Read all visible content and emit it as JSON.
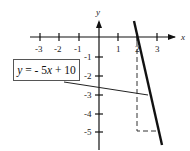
{
  "diagram": {
    "type": "coordinate-plane-line",
    "equation_label": "y = - 5x + 10",
    "equation_parts": {
      "y": "y",
      "rest1": " = - 5",
      "x": "x",
      "rest2": " + 10"
    },
    "x_axis": {
      "label": "x",
      "ticks": [
        "-3",
        "-2",
        "-1",
        "1",
        "2",
        "3"
      ]
    },
    "y_axis": {
      "label": "y",
      "ticks": [
        "-1",
        "-2",
        "-3",
        "-4",
        "-5"
      ]
    },
    "line": {
      "slope": -5,
      "intercept": 10,
      "x_intercept": 2
    },
    "dashed_guide": {
      "from": [
        2,
        0
      ],
      "corner": [
        2,
        -5
      ],
      "to": [
        3,
        -5
      ]
    },
    "colors": {
      "line": "#111111",
      "axes": "#111111",
      "dashed": "#333333"
    }
  }
}
